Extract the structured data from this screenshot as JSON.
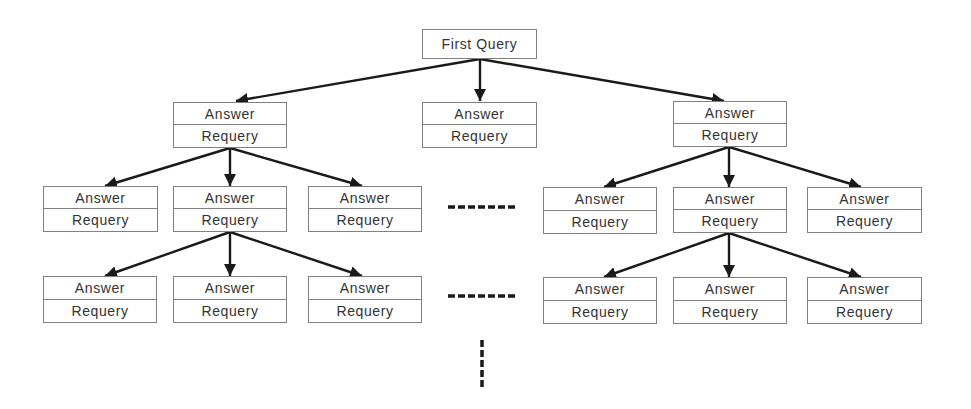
{
  "diagram": {
    "type": "tree",
    "root": {
      "label": "First Query"
    },
    "node_labels": {
      "answer": "Answer",
      "requery": "Requery"
    },
    "ellipsis_horizontal": "·······",
    "ellipsis_vertical": "⋮",
    "levels": [
      {
        "level": 1,
        "parent": "First Query",
        "children": [
          "Answer/Requery",
          "Answer/Requery",
          "Answer/Requery"
        ]
      },
      {
        "level": 2,
        "left_branch_children": 3,
        "right_branch_children": 3,
        "gap": "......"
      },
      {
        "level": 3,
        "left_branch_children": 3,
        "right_branch_children": 3,
        "gap": "......"
      }
    ],
    "colors": {
      "line": "#1a1a1a",
      "border": "#808080",
      "text": "#333333"
    }
  },
  "nodes": {
    "root": "First Query",
    "l1_left": {
      "answer": "Answer",
      "requery": "Requery"
    },
    "l1_mid": {
      "answer": "Answer",
      "requery": "Requery"
    },
    "l1_right": {
      "answer": "Answer",
      "requery": "Requery"
    },
    "l2_a": {
      "answer": "Answer",
      "requery": "Requery"
    },
    "l2_b": {
      "answer": "Answer",
      "requery": "Requery"
    },
    "l2_c": {
      "answer": "Answer",
      "requery": "Requery"
    },
    "l2_d": {
      "answer": "Answer",
      "requery": "Requery"
    },
    "l2_e": {
      "answer": "Answer",
      "requery": "Requery"
    },
    "l2_f": {
      "answer": "Answer",
      "requery": "Requery"
    },
    "l3_a": {
      "answer": "Answer",
      "requery": "Requery"
    },
    "l3_b": {
      "answer": "Answer",
      "requery": "Requery"
    },
    "l3_c": {
      "answer": "Answer",
      "requery": "Requery"
    },
    "l3_d": {
      "answer": "Answer",
      "requery": "Requery"
    },
    "l3_e": {
      "answer": "Answer",
      "requery": "Requery"
    },
    "l3_f": {
      "answer": "Answer",
      "requery": "Requery"
    }
  }
}
